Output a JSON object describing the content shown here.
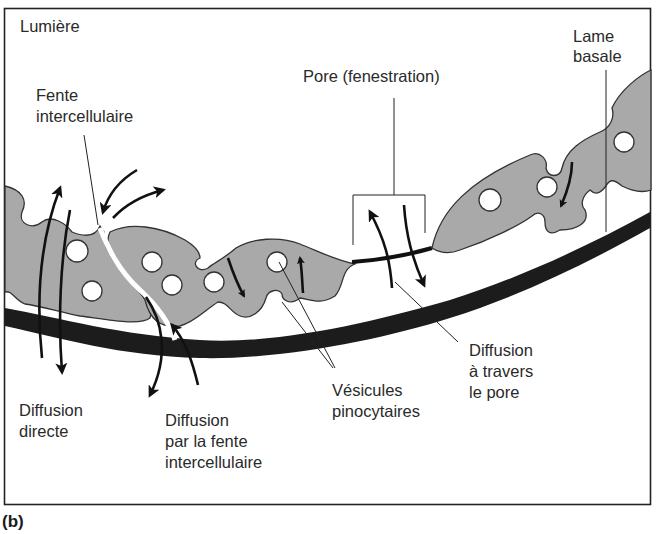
{
  "figure": {
    "panel_label": "(b)",
    "frame": {
      "border_color": "#222222",
      "background": "#ffffff"
    },
    "colors": {
      "cytoplasm": "#a9a9a9",
      "basement_membrane": "#1c1c1c",
      "vesicle": "#ffffff",
      "arrow": "#111111"
    }
  },
  "labels": {
    "lumen": "Lumière",
    "cleft_line1": "Fente",
    "cleft_line2": "intercellulaire",
    "pore": "Pore (fenestration)",
    "basal_line1": "Lame",
    "basal_line2": "basale",
    "direct_line1": "Diffusion",
    "direct_line2": "directe",
    "cleft_diff_line1": "Diffusion",
    "cleft_diff_line2": "par la fente",
    "cleft_diff_line3": "intercellulaire",
    "vesicles_line1": "Vésicules",
    "vesicles_line2": "pinocytaires",
    "pore_diff_line1": "Diffusion",
    "pore_diff_line2": "à travers",
    "pore_diff_line3": "le pore"
  },
  "structures": [
    "endothelial-cell-left",
    "endothelial-cell-middle",
    "endothelial-cell-right",
    "intercellular-cleft",
    "fenestration-pore",
    "basement-membrane",
    "pinocytotic-vesicles"
  ],
  "arrows": [
    {
      "name": "direct-diffusion",
      "directions": [
        "up",
        "down"
      ]
    },
    {
      "name": "cleft-diffusion-top",
      "directions": [
        "in",
        "out"
      ]
    },
    {
      "name": "cleft-diffusion-bottom",
      "directions": [
        "in",
        "out"
      ]
    },
    {
      "name": "pore-diffusion",
      "directions": [
        "up",
        "down"
      ]
    },
    {
      "name": "vesicle-transport",
      "directions": [
        "down",
        "up",
        "down"
      ]
    }
  ]
}
